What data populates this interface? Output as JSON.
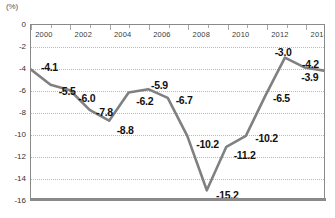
{
  "chart_data": {
    "type": "line",
    "title": "",
    "xlabel": "",
    "ylabel": "",
    "unit_label": "(%)",
    "grid": true,
    "legend": false,
    "xlim": [
      2000,
      2015
    ],
    "ylim": [
      -16,
      0
    ],
    "yticks": [
      "0",
      "-2",
      "-4",
      "-6",
      "-8",
      "-10",
      "-12",
      "-14",
      "-16"
    ],
    "ytick_values": [
      0,
      -2,
      -4,
      -6,
      -8,
      -10,
      -12,
      -14,
      -16
    ],
    "xticks": [
      "2000",
      "2002",
      "2004",
      "2006",
      "2008",
      "2010",
      "2012",
      "2014"
    ],
    "xtick_values": [
      2000,
      2002,
      2004,
      2006,
      2008,
      2010,
      2012,
      2014
    ],
    "x": [
      2000,
      2001,
      2002,
      2003,
      2004,
      2005,
      2006,
      2007,
      2008,
      2009,
      2010,
      2011,
      2012,
      2013,
      2014,
      2015
    ],
    "values": [
      -4.1,
      -5.5,
      -6.0,
      -7.8,
      -8.8,
      -6.2,
      -5.9,
      -6.7,
      -10.2,
      -15.2,
      -11.2,
      -10.2,
      -6.5,
      -3.0,
      -3.9,
      -4.2
    ],
    "series": [
      {
        "name": "series-1",
        "color": "#808080",
        "values": [
          -4.1,
          -5.5,
          -6.0,
          -7.8,
          -8.8,
          -6.2,
          -5.9,
          -6.7,
          -10.2,
          -15.2,
          -11.2,
          -10.2,
          -6.5,
          -3.0,
          -3.9,
          -4.2
        ]
      }
    ],
    "point_labels": [
      {
        "text": "-4.1",
        "x": 2000,
        "y": -4.1,
        "dx": 10,
        "dy": -3
      },
      {
        "text": "-5.5",
        "x": 2001,
        "y": -5.5,
        "dx": 8,
        "dy": 5
      },
      {
        "text": "-6.0",
        "x": 2002,
        "y": -6.0,
        "dx": 8,
        "dy": 7
      },
      {
        "text": "-7.8",
        "x": 2003,
        "y": -7.8,
        "dx": 6,
        "dy": 1
      },
      {
        "text": "-8.8",
        "x": 2004,
        "y": -8.8,
        "dx": 7,
        "dy": 8
      },
      {
        "text": "-6.2",
        "x": 2005,
        "y": -6.2,
        "dx": 7,
        "dy": 8
      },
      {
        "text": "-5.9",
        "x": 2006,
        "y": -5.9,
        "dx": 2,
        "dy": -5
      },
      {
        "text": "-6.7",
        "x": 2007,
        "y": -6.7,
        "dx": 7,
        "dy": 1
      },
      {
        "text": "-10.2",
        "x": 2008,
        "y": -10.2,
        "dx": 8,
        "dy": 7
      },
      {
        "text": "-15.2",
        "x": 2009,
        "y": -15.2,
        "dx": 8,
        "dy": 3
      },
      {
        "text": "-11.2",
        "x": 2010,
        "y": -11.2,
        "dx": 6,
        "dy": 7
      },
      {
        "text": "-10.2",
        "x": 2011,
        "y": -10.2,
        "dx": 8,
        "dy": 1
      },
      {
        "text": "-6.5",
        "x": 2012,
        "y": -6.5,
        "dx": 6,
        "dy": 1
      },
      {
        "text": "-3.0",
        "x": 2013,
        "y": -3.0,
        "dx": -12,
        "dy": -6
      },
      {
        "text": "-3.9",
        "x": 2014,
        "y": -3.9,
        "dx": -5,
        "dy": 9
      },
      {
        "text": "-4.2",
        "x": 2015,
        "y": -4.2,
        "dx": -24,
        "dy": -7
      }
    ]
  },
  "colors": {
    "line": "#808080",
    "grid": "#b9b9b9",
    "frame": "#8a8a8a",
    "text": "#111111",
    "axis_text": "#333333"
  }
}
